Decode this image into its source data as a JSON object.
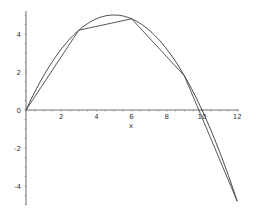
{
  "chart_data": {
    "type": "line",
    "title": "",
    "xlabel": "x",
    "ylabel": "",
    "xlim": [
      0,
      12
    ],
    "ylim": [
      -5,
      5.2
    ],
    "grid": false,
    "legend": null,
    "x_ticks": [
      0,
      2,
      4,
      6,
      8,
      10,
      12
    ],
    "x_tick_labels": [
      "",
      "2",
      "4",
      "6",
      "8",
      "10",
      "12"
    ],
    "y_ticks": [
      -4,
      -2,
      0,
      2,
      4
    ],
    "y_tick_labels": [
      "-4",
      "-2",
      "0",
      "2",
      "4"
    ],
    "series": [
      {
        "name": "curve",
        "style": "smooth",
        "x": [
          0,
          1,
          2,
          3,
          4,
          5,
          6,
          7,
          8,
          9,
          10,
          11,
          12
        ],
        "values": [
          0,
          1.8,
          3.2,
          4.2,
          4.8,
          5.0,
          4.8,
          4.2,
          3.2,
          1.8,
          0,
          -2.2,
          -4.8
        ]
      },
      {
        "name": "piecewise-linear approximation",
        "style": "polyline",
        "x": [
          0,
          3,
          6,
          9,
          12
        ],
        "values": [
          0,
          4.2,
          4.8,
          1.8,
          -4.8
        ]
      }
    ]
  },
  "axes": {
    "x_label": "x",
    "origin_label": "0"
  }
}
